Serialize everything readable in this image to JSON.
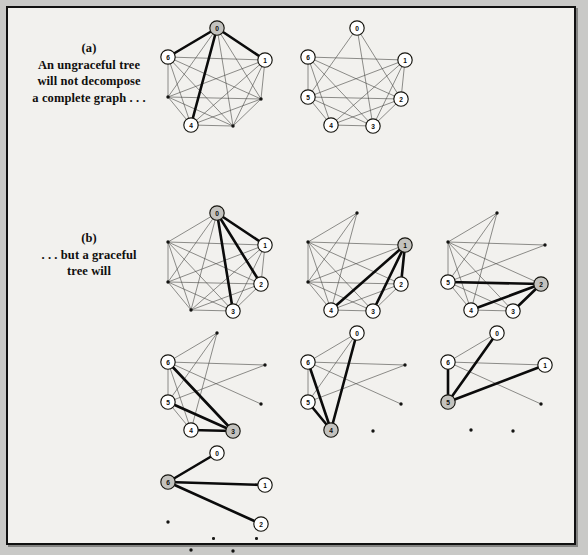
{
  "figure": {
    "background_color": "#f2f1ee",
    "frame_color": "#111111"
  },
  "captions": [
    {
      "id": "caption-a",
      "label": "(a)",
      "lines": [
        "An ungraceful tree",
        "will not decompose",
        "a complete graph . . ."
      ]
    },
    {
      "id": "caption-b",
      "label": "(b)",
      "lines": [
        ". . . but a graceful",
        "tree will"
      ]
    }
  ],
  "graph_layout": {
    "vertex_order": [
      "0",
      "1",
      "2",
      "3",
      "4",
      "5",
      "6"
    ],
    "positions": [
      {
        "id": "0",
        "x": 57,
        "y": 8
      },
      {
        "id": "1",
        "x": 105,
        "y": 40
      },
      {
        "id": "2",
        "x": 101,
        "y": 79
      },
      {
        "id": "3",
        "x": 73,
        "y": 106
      },
      {
        "id": "4",
        "x": 31,
        "y": 105
      },
      {
        "id": "5",
        "x": 8,
        "y": 77
      },
      {
        "id": "6",
        "x": 8,
        "y": 37
      }
    ],
    "node_radius": 7.2,
    "dot_radius": 1.7
  },
  "rows": [
    {
      "row": "a",
      "graphs": [
        {
          "name": "k7-ungraceful-tree",
          "visible_labels": [
            "0",
            "1",
            "4",
            "6"
          ],
          "hub": "0",
          "highlighted_edges": [
            [
              "0",
              "1"
            ],
            [
              "0",
              "6"
            ],
            [
              "0",
              "4"
            ]
          ],
          "removed_edges": [],
          "x": 152,
          "y": 12
        },
        {
          "name": "k7-remaining-after-ungraceful",
          "visible_labels": [
            "0",
            "1",
            "2",
            "3",
            "4",
            "5",
            "6"
          ],
          "hub": null,
          "highlighted_edges": [],
          "removed_edges": [
            [
              "0",
              "1"
            ],
            [
              "0",
              "6"
            ],
            [
              "0",
              "4"
            ]
          ],
          "x": 292,
          "y": 12
        }
      ]
    },
    {
      "row": "b",
      "graphs": [
        {
          "name": "k7-graceful-step-0",
          "visible_labels": [
            "0",
            "1",
            "2",
            "3"
          ],
          "hub": "0",
          "highlighted_edges": [
            [
              "0",
              "1"
            ],
            [
              "0",
              "2"
            ],
            [
              "0",
              "3"
            ]
          ],
          "removed_edges": [],
          "x": 152,
          "y": 197
        },
        {
          "name": "k7-graceful-step-1",
          "visible_labels": [
            "1",
            "2",
            "3",
            "4"
          ],
          "hub": "1",
          "highlighted_edges": [
            [
              "1",
              "2"
            ],
            [
              "1",
              "3"
            ],
            [
              "1",
              "4"
            ]
          ],
          "removed_edges": [
            [
              "0",
              "1"
            ],
            [
              "0",
              "2"
            ],
            [
              "0",
              "3"
            ]
          ],
          "x": 292,
          "y": 197
        },
        {
          "name": "k7-graceful-step-2",
          "visible_labels": [
            "2",
            "3",
            "4",
            "5"
          ],
          "hub": "2",
          "highlighted_edges": [
            [
              "2",
              "3"
            ],
            [
              "2",
              "4"
            ],
            [
              "2",
              "5"
            ]
          ],
          "removed_edges": [
            [
              "0",
              "1"
            ],
            [
              "0",
              "2"
            ],
            [
              "0",
              "3"
            ],
            [
              "1",
              "2"
            ],
            [
              "1",
              "3"
            ],
            [
              "1",
              "4"
            ]
          ],
          "x": 432,
          "y": 197
        }
      ]
    },
    {
      "row": "c",
      "graphs": [
        {
          "name": "k7-graceful-step-3",
          "visible_labels": [
            "3",
            "4",
            "5",
            "6"
          ],
          "hub": "3",
          "highlighted_edges": [
            [
              "3",
              "4"
            ],
            [
              "3",
              "5"
            ],
            [
              "3",
              "6"
            ]
          ],
          "removed_edges": [
            [
              "0",
              "1"
            ],
            [
              "0",
              "2"
            ],
            [
              "0",
              "3"
            ],
            [
              "1",
              "2"
            ],
            [
              "1",
              "3"
            ],
            [
              "1",
              "4"
            ],
            [
              "2",
              "3"
            ],
            [
              "2",
              "4"
            ],
            [
              "2",
              "5"
            ]
          ],
          "x": 152,
          "y": 317
        },
        {
          "name": "k7-graceful-step-4",
          "visible_labels": [
            "0",
            "4",
            "5",
            "6"
          ],
          "hub": "4",
          "highlighted_edges": [
            [
              "4",
              "5"
            ],
            [
              "4",
              "6"
            ],
            [
              "4",
              "0"
            ]
          ],
          "removed_edges": [
            [
              "0",
              "1"
            ],
            [
              "0",
              "2"
            ],
            [
              "0",
              "3"
            ],
            [
              "1",
              "2"
            ],
            [
              "1",
              "3"
            ],
            [
              "1",
              "4"
            ],
            [
              "2",
              "3"
            ],
            [
              "2",
              "4"
            ],
            [
              "2",
              "5"
            ],
            [
              "3",
              "4"
            ],
            [
              "3",
              "5"
            ],
            [
              "3",
              "6"
            ]
          ],
          "x": 292,
          "y": 317
        },
        {
          "name": "k7-graceful-step-5",
          "visible_labels": [
            "0",
            "1",
            "5",
            "6"
          ],
          "hub": "5",
          "highlighted_edges": [
            [
              "5",
              "6"
            ],
            [
              "5",
              "0"
            ],
            [
              "5",
              "1"
            ]
          ],
          "removed_edges": [
            [
              "0",
              "1"
            ],
            [
              "0",
              "2"
            ],
            [
              "0",
              "3"
            ],
            [
              "1",
              "2"
            ],
            [
              "1",
              "3"
            ],
            [
              "1",
              "4"
            ],
            [
              "2",
              "3"
            ],
            [
              "2",
              "4"
            ],
            [
              "2",
              "5"
            ],
            [
              "3",
              "4"
            ],
            [
              "3",
              "5"
            ],
            [
              "3",
              "6"
            ],
            [
              "4",
              "5"
            ],
            [
              "4",
              "6"
            ],
            [
              "0",
              "4"
            ]
          ],
          "x": 432,
          "y": 317
        }
      ]
    },
    {
      "row": "d",
      "graphs": [
        {
          "name": "k7-graceful-step-6",
          "visible_labels": [
            "0",
            "1",
            "2",
            "6"
          ],
          "hub": "6",
          "highlighted_edges": [
            [
              "6",
              "0"
            ],
            [
              "6",
              "1"
            ],
            [
              "6",
              "2"
            ]
          ],
          "removed_edges": [
            [
              "0",
              "1"
            ],
            [
              "0",
              "2"
            ],
            [
              "0",
              "3"
            ],
            [
              "1",
              "2"
            ],
            [
              "1",
              "3"
            ],
            [
              "1",
              "4"
            ],
            [
              "2",
              "3"
            ],
            [
              "2",
              "4"
            ],
            [
              "2",
              "5"
            ],
            [
              "3",
              "4"
            ],
            [
              "3",
              "5"
            ],
            [
              "3",
              "6"
            ],
            [
              "4",
              "5"
            ],
            [
              "4",
              "6"
            ],
            [
              "0",
              "4"
            ],
            [
              "5",
              "6"
            ],
            [
              "0",
              "5"
            ],
            [
              "1",
              "5"
            ]
          ],
          "x": 152,
          "y": 437
        }
      ]
    }
  ],
  "stray_dots": [
    {
      "name": "stray-dot-bottom-left",
      "x": 210,
      "y": 535
    },
    {
      "name": "stray-dot-bottom-right",
      "x": 253,
      "y": 535
    }
  ]
}
